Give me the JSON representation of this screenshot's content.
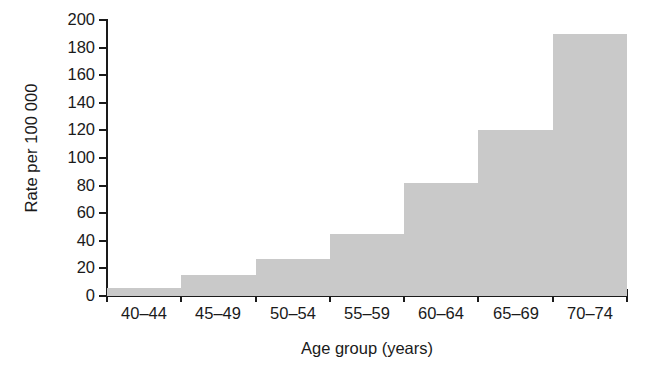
{
  "chart_data": {
    "type": "bar",
    "title": "",
    "xlabel": "Age group (years)",
    "ylabel": "Rate per 100 000",
    "categories": [
      "40–44",
      "45–49",
      "50–54",
      "55–59",
      "60–64",
      "65–69",
      "70–74"
    ],
    "values": [
      6,
      15,
      27,
      45,
      82,
      120,
      190
    ],
    "ylim": [
      0,
      200
    ],
    "y_ticks": [
      0,
      20,
      40,
      60,
      80,
      100,
      120,
      140,
      160,
      180,
      200
    ],
    "y_tick_labels": [
      "0",
      "20",
      "40",
      "60",
      "80",
      "100",
      "120",
      "140",
      "160",
      "180",
      "200"
    ],
    "grid": false,
    "legend": false,
    "bar_color": "#c9c9c9",
    "axis_color": "#1a1a1a",
    "background": "#ffffff",
    "bar_gap": 0
  }
}
